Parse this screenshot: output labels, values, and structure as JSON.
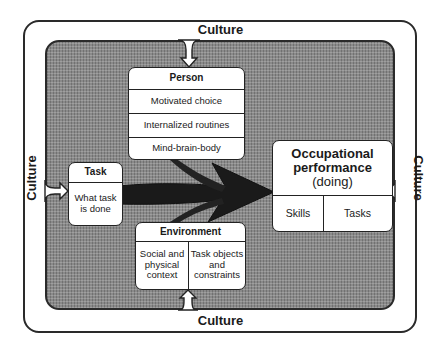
{
  "diagram": {
    "context": {
      "label_top": "Culture",
      "label_bottom": "Culture",
      "label_left": "Culture",
      "label_right": "Culture"
    },
    "person": {
      "header": "Person",
      "items": [
        "Motivated choice",
        "Internalized routines",
        "Mind-brain-body"
      ]
    },
    "task": {
      "header": "Task",
      "body": "What task is done"
    },
    "environment": {
      "header": "Environment",
      "items": [
        "Social and physical context",
        "Task objects and constraints"
      ]
    },
    "occupational_performance": {
      "title_line1": "Occupational",
      "title_line2": "performance",
      "subtitle": "(doing)",
      "items": [
        "Skills",
        "Tasks"
      ]
    },
    "colors": {
      "outline": "#222222",
      "background_shade": "#8a8a8a",
      "arrow": "#1a1a1a",
      "box_fill": "#ffffff"
    }
  }
}
